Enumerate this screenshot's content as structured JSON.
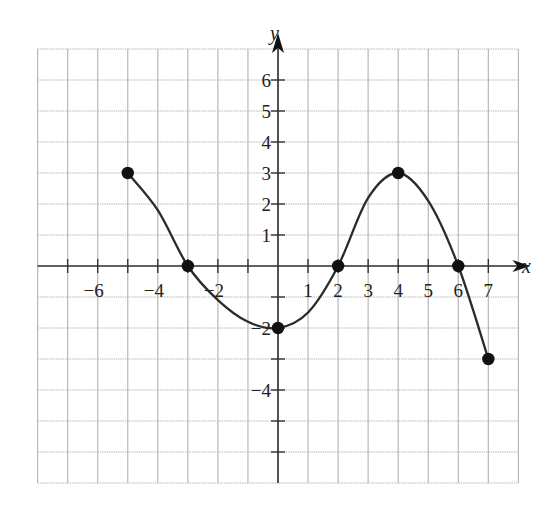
{
  "chart_data": {
    "type": "line",
    "title": "",
    "xlabel": "x",
    "ylabel": "y",
    "xlim": [
      -8,
      8
    ],
    "ylim": [
      -7,
      7
    ],
    "grid": true,
    "x_tick_labels": [
      {
        "value": -6,
        "label": "−6"
      },
      {
        "value": -4,
        "label": "−4"
      },
      {
        "value": -2,
        "label": "−2"
      },
      {
        "value": 1,
        "label": "1"
      },
      {
        "value": 2,
        "label": "2"
      },
      {
        "value": 3,
        "label": "3"
      },
      {
        "value": 4,
        "label": "4"
      },
      {
        "value": 5,
        "label": "5"
      },
      {
        "value": 6,
        "label": "6"
      },
      {
        "value": 7,
        "label": "7"
      }
    ],
    "y_tick_labels": [
      {
        "value": 6,
        "label": "6"
      },
      {
        "value": 5,
        "label": "5"
      },
      {
        "value": 4,
        "label": "4"
      },
      {
        "value": 3,
        "label": "3"
      },
      {
        "value": 2,
        "label": "2"
      },
      {
        "value": 1,
        "label": "1"
      },
      {
        "value": -2,
        "label": "−2"
      },
      {
        "value": -4,
        "label": "−4"
      }
    ],
    "marked_points": [
      {
        "x": -5,
        "y": 3
      },
      {
        "x": -3,
        "y": 0
      },
      {
        "x": 0,
        "y": -2
      },
      {
        "x": 2,
        "y": 0
      },
      {
        "x": 4,
        "y": 3
      },
      {
        "x": 6,
        "y": 0
      },
      {
        "x": 7,
        "y": -3
      }
    ],
    "series": [
      {
        "name": "f(x)",
        "x": [
          -5,
          -4,
          -3,
          -2,
          -1,
          0,
          1,
          2,
          3,
          4,
          5,
          6,
          7
        ],
        "y": [
          3,
          1.8,
          0,
          -1.1,
          -1.8,
          -2,
          -1.5,
          0,
          2.2,
          3,
          2.1,
          0,
          -3
        ]
      }
    ],
    "domain": [
      -5,
      7
    ],
    "range": [
      -3,
      3
    ],
    "colors": {
      "curve": "#2b2b2b",
      "grid": "#b8b8b8",
      "axis": "#333333"
    }
  }
}
